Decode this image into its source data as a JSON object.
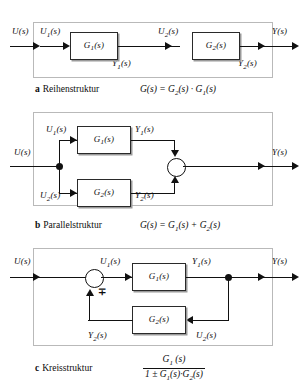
{
  "figure": {
    "ink_color": "#111111",
    "frame_color": "#b9b9b9",
    "background": "#ffffff"
  },
  "diagrams": [
    {
      "tag": "a",
      "caption": "Reihenstruktur",
      "formula": "G(s) = G2(s) · G1(s)",
      "formula_parts": {
        "lhs": "G(s)",
        "eq": "=",
        "first": "G",
        "first_sub": "2",
        "first_arg": "(s)",
        "op": "·",
        "second": "G",
        "second_sub": "1",
        "second_arg": "(s)"
      },
      "blocks": [
        {
          "name": "G",
          "sub": "1",
          "arg": "(s)"
        },
        {
          "name": "G",
          "sub": "2",
          "arg": "(s)"
        }
      ],
      "signals": {
        "input": "U(s)",
        "output": "Y(s)",
        "u1": "U1(s)",
        "u2": "U2(s)",
        "y1": "Y1(s)",
        "y2": "Y2(s)"
      }
    },
    {
      "tag": "b",
      "caption": "Parallelstruktur",
      "formula": "G(s) = G1(s) + G2(s)",
      "formula_parts": {
        "lhs": "G(s)",
        "eq": "=",
        "first": "G",
        "first_sub": "1",
        "first_arg": "(s)",
        "op": "+",
        "second": "G",
        "second_sub": "2",
        "second_arg": "(s)"
      },
      "blocks": [
        {
          "name": "G",
          "sub": "1",
          "arg": "(s)"
        },
        {
          "name": "G",
          "sub": "2",
          "arg": "(s)"
        }
      ],
      "signals": {
        "input": "U(s)",
        "output": "Y(s)",
        "u1": "U1(s)",
        "u2": "U2(s)",
        "y1": "Y1(s)",
        "y2": "Y2(s)"
      },
      "summing_junction": {
        "type": "circle",
        "inputs": 2,
        "signs": [
          "+",
          "+"
        ]
      }
    },
    {
      "tag": "c",
      "caption": "Kreisstruktur",
      "formula": "G1(s) / (1 ± G1(s)·G2(s))",
      "fraction": {
        "numerator": "G1 (s)",
        "denominator": "1 ± G1(s)·G2(s)",
        "num_parts": {
          "g": "G",
          "sub": "1",
          "arg": "(s)"
        },
        "den_parts": {
          "one": "1",
          "pm": "±",
          "first": "G",
          "first_sub": "1",
          "first_arg": "(s)",
          "op": "·",
          "second": "G",
          "second_sub": "2",
          "second_arg": "(s)"
        }
      },
      "blocks": [
        {
          "name": "G",
          "sub": "1",
          "arg": "(s)"
        },
        {
          "name": "G",
          "sub": "2",
          "arg": "(s)"
        }
      ],
      "signals": {
        "input": "U(s)",
        "output": "Y(s)",
        "u1": "U1(s)",
        "u2": "U2(s)",
        "y1": "Y1(s)",
        "y2": "Y2(s)"
      },
      "summing_junction": {
        "type": "circle",
        "inputs": 2,
        "sign_label": "∓"
      }
    }
  ],
  "symbols": {
    "minus_plus": "∓",
    "plus_minus": "±",
    "dot": "·",
    "plus": "+",
    "equals": "="
  }
}
